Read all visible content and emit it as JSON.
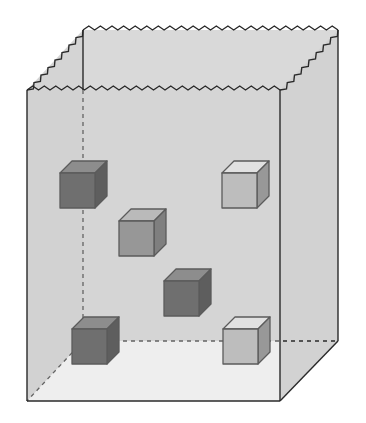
{
  "diagram": {
    "title": "",
    "box_color": "#d6d6d6",
    "line_color": "#2a2a2a",
    "cubes": [
      {
        "shade": "dark",
        "front": "#3c3c3c",
        "top": "#6a6a6a",
        "side": "#222222",
        "x": 60,
        "y": 173
      },
      {
        "shade": "medium",
        "front": "#7a7a7a",
        "top": "#b0b0b0",
        "side": "#555555",
        "x": 119,
        "y": 221
      },
      {
        "shade": "light",
        "front": "#b4b4b4",
        "top": "#ececec",
        "side": "#7c7c7c",
        "x": 222,
        "y": 173
      },
      {
        "shade": "dark",
        "front": "#3c3c3c",
        "top": "#6a6a6a",
        "side": "#222222",
        "x": 164,
        "y": 281
      },
      {
        "shade": "dark",
        "front": "#3c3c3c",
        "top": "#6a6a6a",
        "side": "#222222",
        "x": 72,
        "y": 329
      },
      {
        "shade": "light",
        "front": "#b4b4b4",
        "top": "#ececec",
        "side": "#7c7c7c",
        "x": 223,
        "y": 329
      }
    ]
  }
}
